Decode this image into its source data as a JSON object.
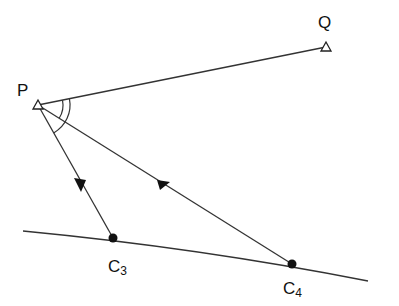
{
  "diagram": {
    "type": "geometry",
    "points": {
      "P": {
        "label": "P",
        "x": 38,
        "y": 105
      },
      "Q": {
        "label": "Q",
        "x": 326,
        "y": 47
      },
      "C3": {
        "label": "C",
        "subscript": "3",
        "x": 113,
        "y": 238
      },
      "C4": {
        "label": "C",
        "subscript": "4",
        "x": 292,
        "y": 264
      }
    },
    "lines": [
      {
        "from": "P",
        "to": "Q"
      },
      {
        "from": "P",
        "to": "C3",
        "arrow": true
      },
      {
        "from": "P",
        "to": "C4",
        "arrow": true
      }
    ],
    "curve": {
      "from": [
        23,
        231
      ],
      "through": [
        "C3",
        "C4"
      ],
      "to": [
        368,
        281
      ]
    },
    "angle_marks": [
      {
        "at": "P",
        "between": [
          "PQ",
          "PC3"
        ],
        "radius": 32
      },
      {
        "at": "P",
        "between": [
          "PQ",
          "PC4"
        ],
        "radius": 25
      }
    ],
    "colors": {
      "stroke": "#222222",
      "background": "#ffffff"
    }
  }
}
